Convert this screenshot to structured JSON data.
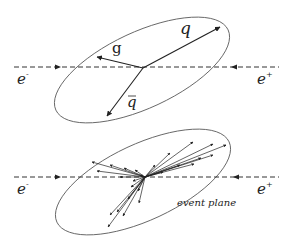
{
  "colors": {
    "line": "#333333",
    "ellipse": "#555555",
    "dash": "#333333",
    "background": "#ffffff"
  },
  "top_diagram": {
    "title": "three-jet event",
    "beam": {
      "y": 67,
      "x_start": 14,
      "x_end": 279,
      "left_arrow_x": 58,
      "right_arrow_x": 234,
      "left_label": "e",
      "left_sup": "-",
      "right_label": "e",
      "right_sup": "+"
    },
    "ellipse": {
      "cx": 142,
      "cy": 70,
      "rx": 95,
      "ry": 38,
      "rotate": -25
    },
    "origin": {
      "x": 143,
      "y": 68
    },
    "jets": [
      {
        "name": "q",
        "label": "q",
        "tip": [
          220,
          27
        ],
        "label_pos": [
          180,
          34
        ]
      },
      {
        "name": "g",
        "label": "g",
        "tip": [
          97,
          57
        ],
        "label_pos": [
          112,
          53
        ]
      },
      {
        "name": "qbar",
        "label": "q",
        "bar": true,
        "tip": [
          107,
          116
        ],
        "label_pos": [
          127,
          107
        ]
      }
    ]
  },
  "bottom_diagram": {
    "title": "multi-particle event",
    "beam": {
      "y": 177,
      "x_start": 14,
      "x_end": 279,
      "left_arrow_x": 58,
      "right_arrow_x": 236,
      "left_label": "e",
      "left_sup": "-",
      "right_label": "e",
      "right_sup": "+"
    },
    "ellipse": {
      "cx": 143,
      "cy": 182,
      "rx": 95,
      "ry": 38,
      "rotate": -25
    },
    "origin": {
      "x": 145,
      "y": 177
    },
    "plane_label": "event plane",
    "plane_label_pos": [
      177,
      206
    ],
    "tracks": [
      [
        193,
        142
      ],
      [
        213,
        144
      ],
      [
        226,
        145
      ],
      [
        213,
        155
      ],
      [
        201,
        158
      ],
      [
        194,
        164
      ],
      [
        180,
        165
      ],
      [
        170,
        153
      ],
      [
        155,
        165
      ],
      [
        163,
        172
      ],
      [
        92,
        162
      ],
      [
        97,
        171
      ],
      [
        110,
        165
      ],
      [
        124,
        168
      ],
      [
        135,
        170
      ],
      [
        120,
        177
      ],
      [
        140,
        175
      ],
      [
        108,
        227
      ],
      [
        110,
        215
      ],
      [
        117,
        212
      ],
      [
        123,
        216
      ],
      [
        128,
        199
      ],
      [
        131,
        187
      ],
      [
        133,
        181
      ],
      [
        138,
        191
      ],
      [
        139,
        203
      ]
    ]
  }
}
